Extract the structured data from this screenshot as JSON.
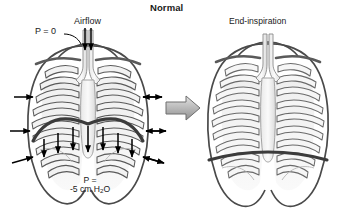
{
  "figure": {
    "title": "Normal",
    "type": "anatomical-diagram",
    "panels": [
      {
        "id": "left",
        "caption": "",
        "state": "resting / inspiration in progress",
        "labels": {
          "airway_pressure": "P = 0",
          "airflow": "Airflow",
          "pleural_pressure_line1": "P =",
          "pleural_pressure_line2_prefix": "-5 cm H",
          "pleural_pressure_subscript": "2",
          "pleural_pressure_line2_suffix": "O"
        },
        "arrows": {
          "airflow_down_count": 2,
          "chest_wall_outward_left_count": 3,
          "chest_wall_outward_right_count": 3,
          "diaphragm_downward_count": 7
        },
        "diaphragm_shape": "domed"
      },
      {
        "id": "right",
        "caption": "End-inspiration",
        "state": "end of inspiration",
        "labels": {},
        "arrows": {},
        "diaphragm_shape": "flattened"
      }
    ],
    "transition_arrow": {
      "direction": "right",
      "style": "3d-gray-block-arrow"
    },
    "colors": {
      "background": "#ffffff",
      "outline": "#4a4a4a",
      "rib_fill": "#f2f2f2",
      "rib_stroke": "#5a5a5a",
      "diaphragm_stroke": "#3b3b3b",
      "lung_shading": "#d8d8d8",
      "arrow_black": "#000000",
      "transition_arrow_fill": "#b8b8b8",
      "transition_arrow_stroke": "#6e6e6e",
      "text": "#1a1a1a"
    }
  }
}
